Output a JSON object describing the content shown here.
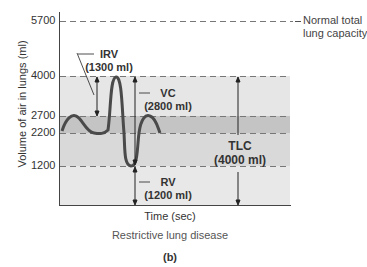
{
  "diagram": {
    "y_axis_label": "Volume of air in lungs (ml)",
    "x_axis_label": "Time (sec)",
    "title": "Restrictive lung disease",
    "panel_label": "(b)",
    "ticks": [
      "5700",
      "4000",
      "2700",
      "2200",
      "1200"
    ],
    "reference_line_label_1": "Normal total",
    "reference_line_label_2": "lung capacity",
    "volumes": {
      "irv": {
        "name": "IRV",
        "value": "(1300 ml)"
      },
      "vc": {
        "name": "VC",
        "value": "(2800 ml)"
      },
      "rv": {
        "name": "RV",
        "value": "(1200 ml)"
      },
      "tlc": {
        "name": "TLC",
        "value": "(4000 ml)"
      }
    },
    "colors": {
      "band_light": "#e6e6e6",
      "band_dark": "#c4c4c4",
      "band_mid": "#d9d9d9",
      "curve": "#4a4a4a",
      "dash": "#777777"
    }
  }
}
